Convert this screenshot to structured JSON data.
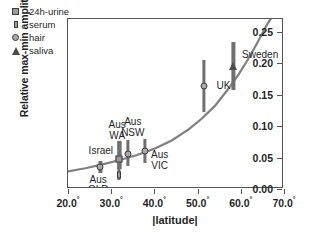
{
  "chart_data": {
    "type": "scatter",
    "title": "",
    "xlabel": "|latitude|",
    "ylabel": "Relative max-min amplitude",
    "xlim": [
      20.0,
      70.0
    ],
    "ylim": [
      0.0,
      0.27
    ],
    "grid": false,
    "xticks": [
      "20.0",
      "30.0",
      "40.0",
      "50.0",
      "60.0",
      "70.0"
    ],
    "xtick_suffix": "°",
    "yticks": [
      "0.00",
      "0.05",
      "0.10",
      "0.15",
      "0.20",
      "0.25"
    ],
    "legend": {
      "position": "top-left-outside",
      "entries": [
        {
          "label": "24h-urine",
          "marker": "square"
        },
        {
          "label": "serum",
          "marker": "rect"
        },
        {
          "label": "hair",
          "marker": "circle"
        },
        {
          "label": "saliva",
          "marker": "triangle"
        }
      ]
    },
    "points": [
      {
        "name": "Aus QLD",
        "label": "Aus\nQLD",
        "marker": "circle",
        "x": 27.5,
        "y": 0.035,
        "ylow": 0.026,
        "yhigh": 0.045,
        "label_x": 27.0,
        "label_y": 0.007,
        "label_align": "center"
      },
      {
        "name": "Israel serum",
        "label": "Israel",
        "marker": "serum",
        "x": 31.8,
        "y": 0.022,
        "ylow": 0.014,
        "yhigh": 0.047,
        "label_x": 33.3,
        "label_y": -0.004,
        "label_align": "center"
      },
      {
        "name": "Aus WA",
        "label": "Aus\nWA",
        "marker": "circle",
        "x": 31.9,
        "y": 0.047,
        "ylow": 0.032,
        "yhigh": 0.077,
        "label_x": 31.4,
        "label_y": 0.093,
        "label_align": "center"
      },
      {
        "name": "Israel urine",
        "label": "Israel",
        "marker": "square",
        "x": 31.9,
        "y": 0.047,
        "ylow": 0.032,
        "yhigh": 0.077,
        "label_x": 27.6,
        "label_y": 0.06,
        "label_align": "center"
      },
      {
        "name": "Aus NSW",
        "label": "Aus\nNSW",
        "marker": "circle",
        "x": 33.9,
        "y": 0.056,
        "ylow": 0.036,
        "yhigh": 0.078,
        "label_x": 35.0,
        "label_y": 0.098,
        "label_align": "center"
      },
      {
        "name": "Aus VIC",
        "label": "Aus\nVIC",
        "marker": "circle",
        "x": 37.8,
        "y": 0.06,
        "ylow": 0.041,
        "yhigh": 0.079,
        "label_x": 41.2,
        "label_y": 0.046,
        "label_align": "center"
      },
      {
        "name": "UK",
        "label": "UK",
        "marker": "circle",
        "x": 51.5,
        "y": 0.163,
        "ylow": 0.122,
        "yhigh": 0.205,
        "label_x": 54.4,
        "label_y": 0.163,
        "label_align": "left"
      },
      {
        "name": "Sweden",
        "label": "Sweden",
        "marker": "triangle",
        "x": 58.3,
        "y": 0.195,
        "ylow": 0.157,
        "yhigh": 0.233,
        "label_x": 60.3,
        "label_y": 0.213,
        "label_align": "left"
      }
    ],
    "fit_curve": {
      "name": "model-fit",
      "color": "#808080",
      "x": [
        20.0,
        24.0,
        28.0,
        32.0,
        36.0,
        40.0,
        44.0,
        48.0,
        51.0,
        54.0,
        57.0,
        59.5,
        61.5,
        63.0,
        64.2,
        65.2,
        66.0,
        66.6,
        67.0
      ],
      "y": [
        0.028,
        0.033,
        0.039,
        0.046,
        0.054,
        0.064,
        0.077,
        0.095,
        0.112,
        0.132,
        0.158,
        0.182,
        0.204,
        0.222,
        0.237,
        0.25,
        0.26,
        0.267,
        0.271
      ]
    }
  },
  "colors": {
    "curve": "#808080",
    "marker_edge": "#3d3d3d",
    "marker_fill": "#a9a9a9",
    "errorbar": "#6f6f6f",
    "axis": "#555555",
    "text": "#1f1f1f"
  }
}
